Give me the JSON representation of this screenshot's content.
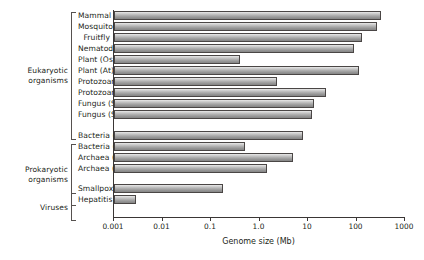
{
  "chart_data": {
    "type": "bar",
    "orientation": "horizontal",
    "title": "",
    "xlabel": "Genome size (Mb)",
    "ylabel": "",
    "xscale": "log",
    "xlim": [
      0.001,
      1000
    ],
    "xticks": [
      "0.001",
      "0.01",
      "0.1",
      "1.0",
      "10",
      "100",
      "1000"
    ],
    "xtick_values": [
      0.001,
      0.01,
      0.1,
      1.0,
      10,
      100,
      1000
    ],
    "grid": false,
    "legend": "none",
    "categories": [
      "Mammal",
      "Mosquito",
      "Fruitfly",
      "Nematode",
      "Plant (Os)",
      "Plant (At)",
      "Protozoan (Ec)",
      "Protozoan (Pl)",
      "Fungus (Sp)",
      "Fungus (Sc)",
      "Bacteria (h)",
      "Bacteria (l)",
      "Archaea (h)",
      "Archaea (l)",
      "Smallpox",
      "Hepatitis B"
    ],
    "values": [
      320,
      260,
      130,
      90,
      0.4,
      110,
      2.3,
      23,
      13,
      12,
      8,
      0.5,
      5,
      1.4,
      0.18,
      0.0028
    ],
    "groups": [
      {
        "label": "Eukaryotic\norganisms",
        "label_line1": "Eukaryotic",
        "label_line2": "organisms",
        "from": 0,
        "to": 9
      },
      {
        "label": "Prokaryotic\norganisms",
        "label_line1": "Prokaryotic",
        "label_line2": "organisms",
        "from": 10,
        "to": 13
      },
      {
        "label": "Viruses",
        "label_line1": "Viruses",
        "label_line2": "",
        "from": 14,
        "to": 15
      }
    ],
    "bar_color": "#a9a9a9",
    "bar_edge_color": "#4a4645",
    "axis_color": "#3a3635"
  }
}
